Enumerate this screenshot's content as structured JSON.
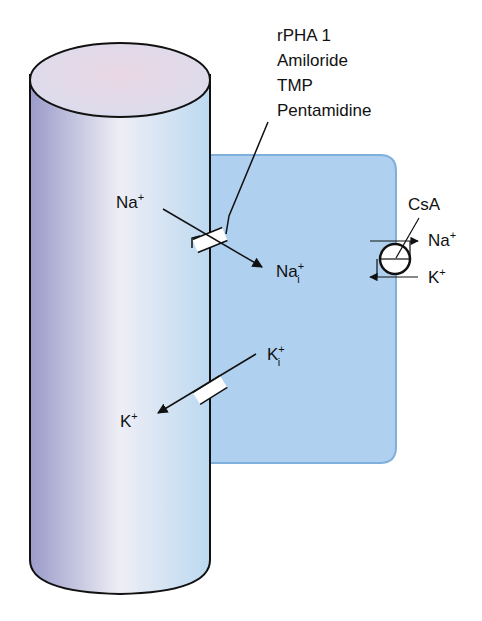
{
  "diagram": {
    "colors": {
      "cell_fill": "#afd0ee",
      "cell_border": "#7fb0dc",
      "cylinder_dark": "#9fa0cc",
      "cylinder_light": "#eeeef6",
      "cylinder_right": "#c2dcf0",
      "cylinder_top": "#e6dbe8",
      "stroke": "#111111"
    },
    "drug_labels": {
      "line1": "rPHA 1",
      "line2": "Amiloride",
      "line3": "TMP",
      "line4": "Pentamidine"
    },
    "sodium_channel": {
      "lumen_label": "Na",
      "lumen_charge": "+",
      "cell_label": "Na",
      "cell_charge": "+",
      "cell_subscript": "i"
    },
    "potassium_channel": {
      "cell_label": "K",
      "cell_charge": "+",
      "cell_subscript": "i",
      "lumen_label": "K",
      "lumen_charge": "+"
    },
    "pump": {
      "inhibitor": "CsA",
      "na_label": "Na",
      "na_charge": "+",
      "k_label": "K",
      "k_charge": "+"
    }
  }
}
